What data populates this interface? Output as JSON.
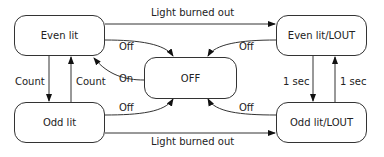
{
  "states": {
    "even_lit": "Even lit",
    "off": "OFF",
    "odd_lit": "Odd lit",
    "even_lit_lout": "Even lit/LOUT",
    "odd_lit_lout": "Odd lit/LOUT"
  },
  "transitions": {
    "even_to_even_lout": "Light burned out",
    "odd_to_odd_lout": "Light burned out",
    "even_to_off": "Off",
    "off_to_even": "On",
    "odd_to_off": "Off",
    "even_lout_to_off": "Off",
    "odd_lout_to_off": "Off",
    "even_to_odd": "Count",
    "odd_to_even": "Count",
    "even_lout_to_odd_lout": "1 sec",
    "odd_lout_to_even_lout": "1 sec"
  }
}
